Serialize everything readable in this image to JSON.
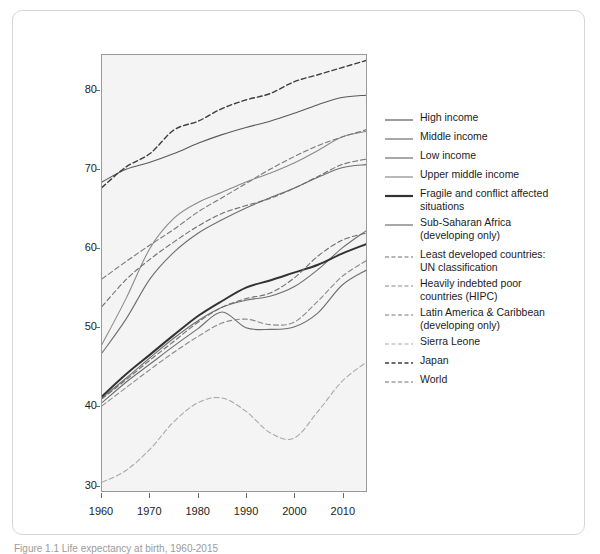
{
  "caption": "Figure 1.1 Life expectancy at birth, 1960-2015",
  "chart_data": {
    "type": "line",
    "title": "",
    "xlabel": "",
    "ylabel": "",
    "xlim": [
      1960,
      2015
    ],
    "ylim": [
      29.2,
      84.5
    ],
    "xticks": [
      1960,
      1970,
      1980,
      1990,
      2000,
      2010
    ],
    "yticks": [
      30,
      40,
      50,
      60,
      70,
      80
    ],
    "grid": false,
    "legend_position": "right",
    "plot_background": "#f4f4f4",
    "x": [
      1960,
      1965,
      1970,
      1975,
      1980,
      1985,
      1990,
      1995,
      2000,
      2005,
      2010,
      2015
    ],
    "series": [
      {
        "name": "High income",
        "style": "solid",
        "color": "#595959",
        "width": 1.1,
        "values": [
          68.4,
          70.0,
          70.9,
          72.0,
          73.3,
          74.4,
          75.3,
          76.1,
          77.1,
          78.2,
          79.1,
          79.4
        ]
      },
      {
        "name": "Middle income",
        "style": "solid",
        "color": "#6e6e6e",
        "width": 1.1,
        "values": [
          46.7,
          51.0,
          56.1,
          59.5,
          61.9,
          63.6,
          65.1,
          66.4,
          67.6,
          69.0,
          70.2,
          70.6
        ]
      },
      {
        "name": "Low income",
        "style": "solid",
        "color": "#6e6e6e",
        "width": 1.1,
        "values": [
          41.0,
          43.5,
          46.1,
          48.6,
          50.8,
          52.5,
          53.4,
          53.9,
          55.1,
          57.3,
          60.0,
          62.2
        ]
      },
      {
        "name": "Upper middle income",
        "style": "solid",
        "color": "#8a8a8a",
        "width": 1.1,
        "values": [
          47.8,
          53.6,
          60.0,
          63.8,
          65.8,
          67.1,
          68.4,
          69.5,
          70.8,
          72.4,
          74.1,
          74.8
        ]
      },
      {
        "name": "Fragile and conflict affected\nsituations",
        "style": "solid",
        "color": "#333333",
        "width": 2.0,
        "values": [
          41.2,
          44.0,
          46.5,
          49.0,
          51.4,
          53.3,
          55.0,
          55.9,
          56.9,
          57.9,
          59.3,
          60.5
        ]
      },
      {
        "name": "Sub-Saharan Africa\n(developing only)",
        "style": "solid",
        "color": "#6e6e6e",
        "width": 1.1,
        "values": [
          40.4,
          43.0,
          45.3,
          47.6,
          49.8,
          51.9,
          49.9,
          49.7,
          50.0,
          51.8,
          55.3,
          57.2
        ]
      },
      {
        "name": "Least developed countries:\nUN classification",
        "style": "dashed",
        "color": "#6e6e6e",
        "width": 1.1,
        "values": [
          40.9,
          43.3,
          45.8,
          48.2,
          50.6,
          52.5,
          53.6,
          54.3,
          56.2,
          59.0,
          61.0,
          61.9
        ]
      },
      {
        "name": "Heavily indebted poor\ncountries (HIPC)",
        "style": "dashed",
        "color": "#8a8a8a",
        "width": 1.1,
        "values": [
          40.0,
          42.3,
          44.6,
          46.8,
          48.8,
          50.5,
          51.0,
          50.3,
          50.6,
          53.3,
          56.4,
          58.4
        ]
      },
      {
        "name": "Latin America & Caribbean\n(developing only)",
        "style": "dashed",
        "color": "#787878",
        "width": 1.1,
        "values": [
          56.1,
          58.3,
          60.4,
          62.4,
          64.6,
          66.4,
          68.2,
          70.0,
          71.6,
          73.0,
          74.1,
          75.0
        ]
      },
      {
        "name": "Sierra Leone",
        "style": "dashed",
        "color": "#a8a8a8",
        "width": 1.1,
        "values": [
          30.3,
          31.8,
          34.5,
          38.0,
          40.4,
          41.0,
          39.3,
          36.6,
          35.9,
          39.3,
          43.1,
          45.5
        ]
      },
      {
        "name": "Japan",
        "style": "dashed",
        "color": "#3d3d3d",
        "width": 1.4,
        "values": [
          67.7,
          70.3,
          72.0,
          75.0,
          76.1,
          77.7,
          78.8,
          79.6,
          81.1,
          82.0,
          82.9,
          83.8
        ]
      },
      {
        "name": "World",
        "style": "dashed",
        "color": "#6e6e6e",
        "width": 1.1,
        "values": [
          52.6,
          56.0,
          58.6,
          60.8,
          62.8,
          64.4,
          65.4,
          66.3,
          67.6,
          69.1,
          70.6,
          71.3
        ]
      }
    ]
  },
  "legend": {
    "items": [
      {
        "label": "High income",
        "style": "solid",
        "color": "#595959",
        "width": 1.2
      },
      {
        "label": "Middle income",
        "style": "solid",
        "color": "#6e6e6e",
        "width": 1.2
      },
      {
        "label": "Low income",
        "style": "solid",
        "color": "#6e6e6e",
        "width": 1.2
      },
      {
        "label": "Upper middle income",
        "style": "solid",
        "color": "#8a8a8a",
        "width": 1.2
      },
      {
        "label": "Fragile and conflict affected\nsituations",
        "style": "solid",
        "color": "#333333",
        "width": 2.2
      },
      {
        "label": "Sub-Saharan Africa\n(developing only)",
        "style": "solid",
        "color": "#6e6e6e",
        "width": 1.2
      },
      {
        "label": "Least developed countries:\nUN classification",
        "style": "dashed",
        "color": "#6e6e6e",
        "width": 1.2
      },
      {
        "label": "Heavily indebted poor\ncountries (HIPC)",
        "style": "dashed",
        "color": "#8a8a8a",
        "width": 1.2
      },
      {
        "label": "Latin America & Caribbean\n(developing only)",
        "style": "dashed",
        "color": "#787878",
        "width": 1.2
      },
      {
        "label": "Sierra Leone",
        "style": "dashed",
        "color": "#a8a8a8",
        "width": 1.2
      },
      {
        "label": "Japan",
        "style": "dashed",
        "color": "#3d3d3d",
        "width": 1.6
      },
      {
        "label": "World",
        "style": "dashed",
        "color": "#6e6e6e",
        "width": 1.2
      }
    ]
  }
}
